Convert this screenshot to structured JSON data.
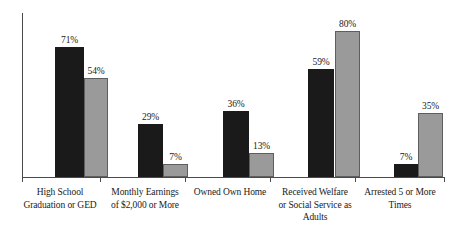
{
  "chart_data": {
    "type": "bar",
    "title": "",
    "subtitle": "",
    "xlabel": "",
    "ylabel": "",
    "ylim": [
      0,
      90
    ],
    "grid": false,
    "legend_position": "none",
    "orientation": "vertical",
    "grouping": "grouped",
    "value_suffix": "%",
    "categories": [
      "High School Graduation or GED",
      "Monthly Earnings of $2,000 or More",
      "Owned Own Home",
      "Received Welfare or Social Service as Adults",
      "Arrested 5 or More Times"
    ],
    "category_lines": [
      [
        "High School",
        "Graduation or GED"
      ],
      [
        "Monthly Earnings",
        "of $2,000 or More"
      ],
      [
        "Owned Own Home"
      ],
      [
        "Received Welfare",
        "or Social Service as",
        "Adults"
      ],
      [
        "Arrested 5 or More",
        "Times"
      ]
    ],
    "series": [
      {
        "name": "series-a",
        "color": "#1a1a1a",
        "values": [
          71,
          29,
          36,
          59,
          7
        ],
        "labels": [
          "71%",
          "29%",
          "36%",
          "59%",
          "7%"
        ]
      },
      {
        "name": "series-b",
        "color": "#9a9a9a",
        "values": [
          54,
          7,
          13,
          80,
          35
        ],
        "labels": [
          "54%",
          "7%",
          "13%",
          "80%",
          "35%"
        ]
      }
    ],
    "axis_color": "#4a4a4a"
  },
  "layout": {
    "baseline_y": 177,
    "px_per_unit": 1.83,
    "groups": [
      {
        "a_left": 33,
        "a_width": 29,
        "b_left": 62,
        "b_width": 24
      },
      {
        "a_left": 116,
        "a_width": 25,
        "b_left": 141,
        "b_width": 25
      },
      {
        "a_left": 201,
        "a_width": 26,
        "b_left": 227,
        "b_width": 25
      },
      {
        "a_left": 286,
        "a_width": 26,
        "b_left": 313,
        "b_width": 25
      },
      {
        "a_left": 372,
        "a_width": 24,
        "b_left": 396,
        "b_width": 25
      }
    ],
    "ticks": [
      22,
      100,
      185,
      270,
      355,
      444
    ],
    "cat_label_centers": [
      60,
      145,
      230,
      315,
      400
    ],
    "cat_label_width": 108
  }
}
